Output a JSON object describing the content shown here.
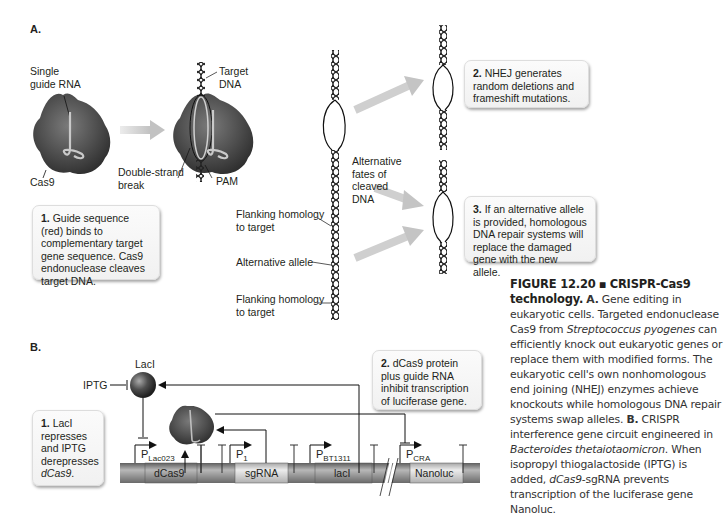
{
  "figure": {
    "number": "FIGURE 12.20",
    "separator": "▪",
    "title": "CRISPR-Cas9 technology.",
    "caption_parts": [
      {
        "text": "A.",
        "style": "bold"
      },
      {
        "text": " Gene editing in eukaryotic cells. Targeted endonuclease Cas9 from ",
        "style": "normal"
      },
      {
        "text": "Streptococcus pyogenes",
        "style": "italic"
      },
      {
        "text": " can efficiently knock out eukaryotic genes or replace them with modified forms. The eukaryotic cell's own nonhomologous end joining (NHEJ) enzymes achieve knockouts while homologous DNA repair systems swap alleles. ",
        "style": "normal"
      },
      {
        "text": "B.",
        "style": "bold"
      },
      {
        "text": " CRISPR interference gene circuit engineered in ",
        "style": "normal"
      },
      {
        "text": "Bacteroides thetaiotaomicron",
        "style": "italic"
      },
      {
        "text": ". When isopropyl thiogalactoside (IPTG) is added, ",
        "style": "normal"
      },
      {
        "text": "dCas9",
        "style": "italic"
      },
      {
        "text": "-sgRNA prevents transcription of the luciferase gene Nanoluc.",
        "style": "normal"
      }
    ]
  },
  "panelA": {
    "letter": "A.",
    "labels": {
      "single_guide_rna": "Single\nguide RNA",
      "cas9": "Cas9",
      "target_dna": "Target\nDNA",
      "double_strand_break": "Double-strand\nbreak",
      "pam": "PAM",
      "alternative_fates": "Alternative\nfates of\ncleaved\nDNA",
      "flanking_top": "Flanking homology\nto target",
      "alternative_allele": "Alternative allele",
      "flanking_bottom": "Flanking homology\nto target"
    },
    "callouts": [
      {
        "num": "1.",
        "text": " Guide sequence (red) binds to complementary target gene sequence. Cas9 endonuclease cleaves target DNA."
      },
      {
        "num": "2.",
        "text": " NHEJ generates random deletions and frameshift mutations."
      },
      {
        "num": "3.",
        "text": " If an alternative allele is provided, homologous DNA repair systems will replace the damaged gene with the new allele."
      }
    ]
  },
  "panelB": {
    "letter": "B.",
    "labels": {
      "laci_protein": "LacI",
      "iptg": "IPTG"
    },
    "promoters": [
      {
        "main": "P",
        "sub": "Lac023"
      },
      {
        "main": "P",
        "sub": "1"
      },
      {
        "main": "P",
        "sub": "BT1311"
      },
      {
        "main": "P",
        "sub": "CRA"
      }
    ],
    "genes": [
      "dCas9",
      "sgRNA",
      "lacI",
      "Nanoluc"
    ],
    "callouts": [
      {
        "num": "1.",
        "text": " LacI represses and IPTG derepresses ",
        "italic_tail": "dCas9",
        "tail": "."
      },
      {
        "num": "2.",
        "text": " dCas9 protein plus guide RNA inhibit transcription of luciferase gene."
      }
    ]
  },
  "colors": {
    "protein": "#4a4a4a",
    "arrow_gray": "#c8c8c8",
    "bar_dark": "#8a8a8a",
    "bar_light": "#d6d6d6"
  }
}
